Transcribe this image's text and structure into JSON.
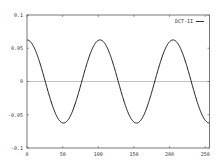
{
  "chart_data": {
    "type": "line",
    "title": "",
    "xlabel": "",
    "ylabel": "",
    "xlim": [
      0,
      256
    ],
    "ylim": [
      -0.1,
      0.1
    ],
    "x_ticks": [
      0,
      50,
      100,
      150,
      200,
      250
    ],
    "x_tick_labels": [
      "0",
      "50",
      "100",
      "150",
      "200",
      "250"
    ],
    "y_ticks": [
      0.1,
      0.05,
      0,
      -0.05,
      -0.1
    ],
    "y_tick_labels": [
      "0.1",
      "0.05",
      "0",
      "-0.05",
      "-0.1"
    ],
    "grid": false,
    "zero_line": true,
    "legend_position": "top-right",
    "series": [
      {
        "name": "DCT-II",
        "color": "#000000",
        "description": "cosine basis, amplitude ~0.0625, period ~102.4 samples",
        "amplitude": 0.0625,
        "period": 102.4,
        "x": [
          0,
          25.6,
          51.2,
          76.8,
          102.4,
          128,
          153.6,
          179.2,
          204.8,
          230.4,
          256
        ],
        "values": [
          0.0625,
          0,
          -0.0625,
          0,
          0.0625,
          0,
          -0.0625,
          0,
          0.0625,
          0,
          -0.0625
        ]
      }
    ]
  },
  "legend": {
    "label": "DCT-II"
  }
}
